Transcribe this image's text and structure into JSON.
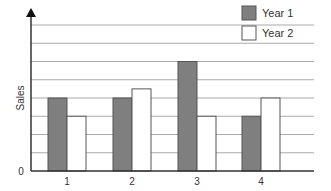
{
  "chart_data": {
    "type": "bar",
    "title": "",
    "xlabel": "",
    "ylabel": "Sales",
    "categories": [
      "1",
      "2",
      "3",
      "4"
    ],
    "series": [
      {
        "name": "Year 1",
        "values": [
          4,
          4,
          6,
          3
        ],
        "color": "#7f7f7f"
      },
      {
        "name": "Year 2",
        "values": [
          3,
          4.5,
          3,
          4
        ],
        "color": "#ffffff"
      }
    ],
    "ylim": [
      0,
      8
    ],
    "y_tick_labels": [
      "0"
    ],
    "grid": true,
    "gridline_count": 8,
    "legend_position": "top-right"
  },
  "colors": {
    "year1_fill": "#7f7f7f",
    "year2_fill": "#ffffff",
    "bar_stroke": "#555555",
    "grid": "#aaaaaa",
    "axis": "#333333"
  }
}
